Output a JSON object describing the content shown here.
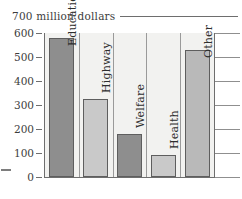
{
  "chart_data": {
    "type": "bar",
    "title": "",
    "annotation": "700 million dollars",
    "xlabel": "",
    "ylabel": "",
    "ylim": [
      0,
      700
    ],
    "grid": true,
    "legend": "none",
    "units": "million dollars",
    "categories": [
      "Education",
      "Highway",
      "Welfare",
      "Health",
      "Other"
    ],
    "values": [
      580,
      325,
      180,
      90,
      530
    ],
    "ticks": [
      "600",
      "500",
      "400",
      "300",
      "200",
      "100",
      "0"
    ],
    "tick_values": [
      600,
      500,
      400,
      300,
      200,
      100,
      0
    ],
    "bar_colors": [
      "#8e8e8e",
      "#c9c9c9",
      "#8e8e8e",
      "#c9c9c9",
      "#b9b9b9"
    ],
    "series": [
      {
        "name": "Spending",
        "values": [
          580,
          325,
          180,
          90,
          530
        ]
      }
    ]
  },
  "axis": {
    "ticks": [
      {
        "label": "600",
        "value": 600
      },
      {
        "label": "500",
        "value": 500
      },
      {
        "label": "400",
        "value": 400
      },
      {
        "label": "300",
        "value": 300
      },
      {
        "label": "200",
        "value": 200
      },
      {
        "label": "100",
        "value": 100
      },
      {
        "label": "0",
        "value": 0
      }
    ]
  },
  "bars": [
    {
      "label": "Education",
      "value": 580,
      "color": "#8e8e8e",
      "label_inside": true
    },
    {
      "label": "Highway",
      "value": 325,
      "color": "#c9c9c9",
      "label_inside": false
    },
    {
      "label": "Welfare",
      "value": 180,
      "color": "#8e8e8e",
      "label_inside": false
    },
    {
      "label": "Health",
      "value": 90,
      "color": "#c9c9c9",
      "label_inside": false
    },
    {
      "label": "Other",
      "value": 530,
      "color": "#b9b9b9",
      "label_inside": true
    }
  ],
  "annotation": {
    "text": "700 million dollars"
  },
  "colors": {
    "dark_bar": "#8e8e8e",
    "light_bar": "#c9c9c9",
    "mid_bar": "#b9b9b9",
    "grid": "#8f8f8f",
    "axis": "#6e6e6e",
    "plot_bg": "#f2f2f0",
    "text": "#3d3d3d"
  }
}
